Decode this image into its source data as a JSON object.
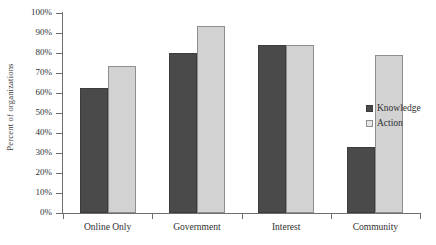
{
  "chart_data": {
    "type": "bar",
    "title": "",
    "xlabel": "",
    "ylabel": "Percent of organizations",
    "ylim": [
      0,
      100
    ],
    "ytick_labels": [
      "0%",
      "10%",
      "20%",
      "30%",
      "40%",
      "50%",
      "60%",
      "70%",
      "80%",
      "90%",
      "100%"
    ],
    "ytick_values": [
      0,
      10,
      20,
      30,
      40,
      50,
      60,
      70,
      80,
      90,
      100
    ],
    "grid": false,
    "legend_position": "right",
    "categories": [
      "Online Only",
      "Government",
      "Interest",
      "Community"
    ],
    "series": [
      {
        "name": "Knowledge",
        "color": "#4a4a4a",
        "values": [
          62.5,
          80,
          84,
          33
        ]
      },
      {
        "name": "Action",
        "color": "#d2d2d2",
        "values": [
          73.5,
          93.5,
          84,
          79
        ]
      }
    ]
  }
}
